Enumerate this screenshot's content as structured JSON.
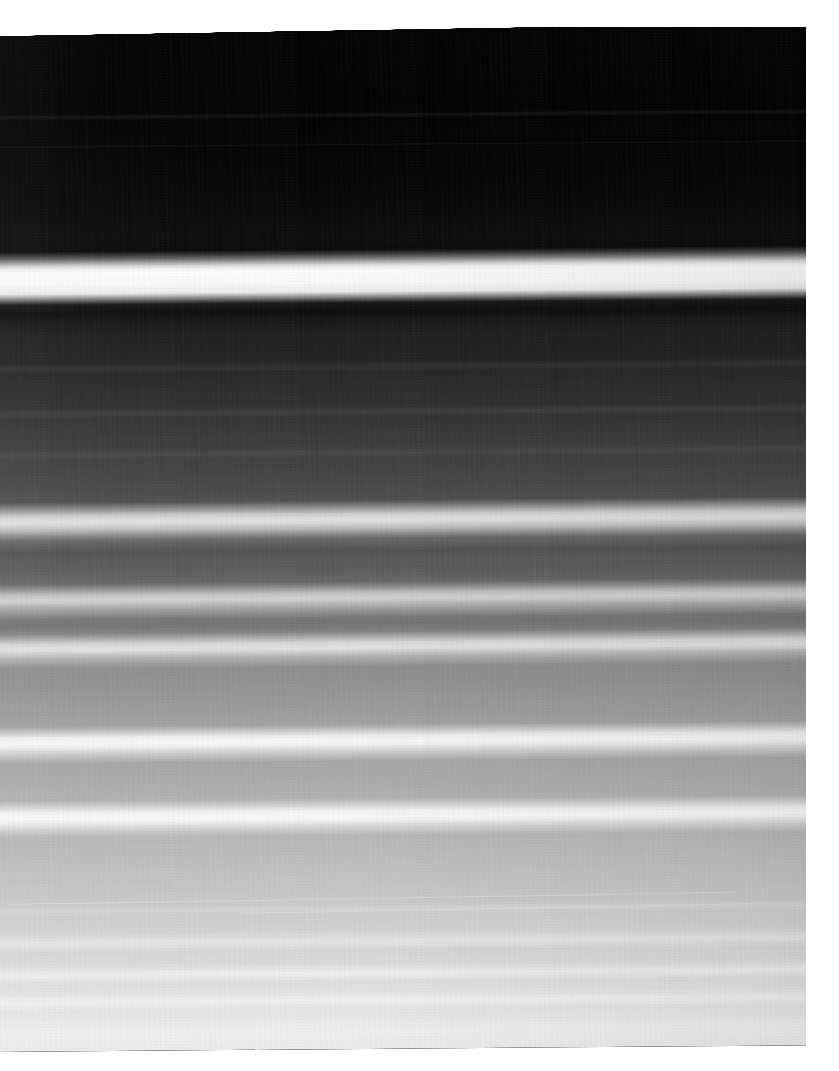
{
  "page": {
    "background_color": "#ffffff",
    "width": 839,
    "height": 1071,
    "corner_marks": [
      "mark-1",
      "mark-2",
      "mark-3"
    ]
  },
  "plate": {
    "name": "ring-plate",
    "caption": "",
    "description": "Grayscale spacecraft image of a planetary ring system showing horizontal ring bands, scanned slightly askew on a white page",
    "rotation_deg": -0.46,
    "left": -14,
    "top": 24,
    "width": 824,
    "height": 1028,
    "tone_dark": "#020202",
    "tone_mid": "#8f8f8f",
    "tone_light": "#ededed",
    "tone_highlight": "#fbfbfb"
  },
  "chart_data": {
    "type": "line",
    "xlabel": "",
    "ylabel": "Relative brightness (0–255)",
    "x": [
      0,
      30,
      60,
      90,
      120,
      150,
      180,
      210,
      240,
      255,
      262,
      270,
      278,
      286,
      300,
      320,
      350,
      380,
      410,
      440,
      460,
      480,
      500,
      512,
      520,
      530,
      545,
      558,
      566,
      574,
      586,
      598,
      606,
      614,
      628,
      650,
      672,
      690,
      704,
      712,
      718,
      726,
      740,
      760,
      782,
      790,
      798,
      812,
      840,
      870,
      900,
      916,
      924,
      940,
      950,
      958,
      968,
      980,
      992,
      1000,
      1012,
      1028
    ],
    "y": [
      3,
      2,
      3,
      4,
      6,
      8,
      9,
      10,
      12,
      14,
      60,
      250,
      235,
      40,
      24,
      28,
      32,
      40,
      48,
      58,
      68,
      76,
      84,
      190,
      205,
      120,
      96,
      100,
      180,
      188,
      140,
      132,
      205,
      212,
      160,
      148,
      152,
      158,
      164,
      225,
      238,
      190,
      168,
      172,
      236,
      242,
      206,
      184,
      190,
      196,
      206,
      214,
      222,
      218,
      224,
      232,
      226,
      230,
      238,
      232,
      238,
      240
    ],
    "ylim": [
      0,
      255
    ],
    "grid": false,
    "legend": false,
    "series": [
      {
        "name": "ring-brightness",
        "values": [
          3,
          2,
          3,
          4,
          6,
          8,
          9,
          10,
          12,
          14,
          60,
          250,
          235,
          40,
          24,
          28,
          32,
          40,
          48,
          58,
          68,
          76,
          84,
          190,
          205,
          120,
          96,
          100,
          180,
          188,
          140,
          132,
          205,
          212,
          160,
          148,
          152,
          158,
          164,
          225,
          238,
          190,
          168,
          172,
          236,
          242,
          206,
          184,
          190,
          196,
          206,
          214,
          222,
          218,
          224,
          232,
          226,
          230,
          238,
          232,
          238,
          240
        ]
      }
    ]
  },
  "bands": [
    {
      "name": "band-faint-upper",
      "top_pct": 9.0,
      "height_px": 2,
      "color": "rgba(255,255,255,0.10)",
      "blur": 1
    },
    {
      "name": "band-bright-primary",
      "top_pct": 23.6,
      "height_px": 13,
      "color": "rgba(255,255,255,0.95)",
      "blur": 4
    },
    {
      "name": "band-dark-inner",
      "top_pct": 27.6,
      "height_px": 10,
      "color": "rgba(0,0,0,0.45)",
      "blur": 4
    },
    {
      "name": "band-faint-a",
      "top_pct": 33.5,
      "height_px": 3,
      "color": "rgba(255,255,255,0.10)",
      "blur": 2
    },
    {
      "name": "band-faint-b",
      "top_pct": 37.8,
      "height_px": 3,
      "color": "rgba(255,255,255,0.10)",
      "blur": 2
    },
    {
      "name": "band-faint-c",
      "top_pct": 41.8,
      "height_px": 3,
      "color": "rgba(255,255,255,0.09)",
      "blur": 2
    },
    {
      "name": "band-bright-1",
      "top_pct": 48.2,
      "height_px": 7,
      "color": "rgba(255,255,255,0.50)",
      "blur": 3
    },
    {
      "name": "band-dark-1",
      "top_pct": 51.0,
      "height_px": 10,
      "color": "rgba(0,0,0,0.16)",
      "blur": 4
    },
    {
      "name": "band-bright-2",
      "top_pct": 55.8,
      "height_px": 6,
      "color": "rgba(255,255,255,0.42)",
      "blur": 3
    },
    {
      "name": "band-dark-2",
      "top_pct": 58.3,
      "height_px": 9,
      "color": "rgba(0,0,0,0.14)",
      "blur": 4
    },
    {
      "name": "band-bright-3",
      "top_pct": 60.6,
      "height_px": 6,
      "color": "rgba(255,255,255,0.48)",
      "blur": 3
    },
    {
      "name": "band-bright-4",
      "top_pct": 69.7,
      "height_px": 7,
      "color": "rgba(255,255,255,0.72)",
      "blur": 3
    },
    {
      "name": "band-bright-5",
      "top_pct": 77.0,
      "height_px": 7,
      "color": "rgba(255,255,255,0.74)",
      "blur": 3
    },
    {
      "name": "band-faint-d",
      "top_pct": 86.2,
      "height_px": 3,
      "color": "rgba(255,255,255,0.30)",
      "blur": 2
    },
    {
      "name": "band-faint-e",
      "top_pct": 89.3,
      "height_px": 5,
      "color": "rgba(255,255,255,0.38)",
      "blur": 3
    },
    {
      "name": "band-faint-f",
      "top_pct": 92.4,
      "height_px": 5,
      "color": "rgba(255,255,255,0.42)",
      "blur": 3
    },
    {
      "name": "band-faint-g",
      "top_pct": 95.2,
      "height_px": 4,
      "color": "rgba(255,255,255,0.34)",
      "blur": 3
    },
    {
      "name": "band-faint-h",
      "top_pct": 97.6,
      "height_px": 4,
      "color": "rgba(255,255,255,0.30)",
      "blur": 3
    }
  ],
  "streaks": [
    {
      "name": "scratch-1",
      "top_pct": 85.3,
      "left_pct": 2,
      "width_pct": 88,
      "rotate_deg": -0.5,
      "opacity": 0.45
    },
    {
      "name": "scratch-2",
      "top_pct": 86.4,
      "left_pct": 30,
      "width_pct": 62,
      "rotate_deg": -0.6,
      "opacity": 0.35
    },
    {
      "name": "scratch-3",
      "top_pct": 12.0,
      "left_pct": 0,
      "width_pct": 100,
      "rotate_deg": 0,
      "opacity": 0.1
    }
  ]
}
